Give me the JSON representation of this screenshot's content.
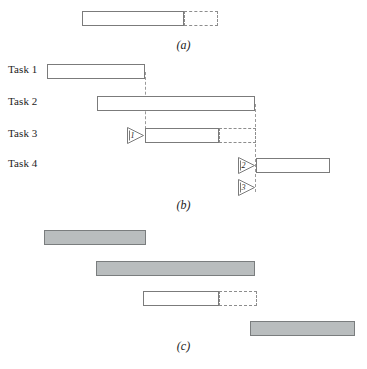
{
  "figure": {
    "type": "gantt-schedule-diagram",
    "panels": [
      {
        "key": "a",
        "caption": "(a)",
        "caption_y": 38,
        "bars": [
          {
            "name": "bar-a-actual",
            "style": "solid",
            "x": 82,
            "y": 11,
            "w": 102,
            "label": ""
          },
          {
            "name": "bar-a-float",
            "style": "dashed",
            "x": 184,
            "y": 11,
            "w": 34,
            "label": ""
          }
        ],
        "vlines": [],
        "hlines": [],
        "markers": []
      },
      {
        "key": "b",
        "caption": "(b)",
        "caption_y": 198,
        "rows": [
          {
            "name": "row-label-task-1",
            "label": "Task 1",
            "x": 8,
            "y": 64
          },
          {
            "name": "row-label-task-2",
            "label": "Task 2",
            "x": 8,
            "y": 96
          },
          {
            "name": "row-label-task-3",
            "label": "Task 3",
            "x": 8,
            "y": 128
          },
          {
            "name": "row-label-task-4",
            "label": "Task 4",
            "x": 8,
            "y": 158
          }
        ],
        "bars": [
          {
            "name": "bar-task-1",
            "style": "solid",
            "x": 47,
            "y": 64,
            "w": 98,
            "label": ""
          },
          {
            "name": "bar-task-2",
            "style": "solid",
            "x": 97,
            "y": 96,
            "w": 158,
            "label": ""
          },
          {
            "name": "bar-task-3-actual",
            "style": "solid",
            "x": 145,
            "y": 128,
            "w": 74,
            "label": ""
          },
          {
            "name": "bar-task-3-float",
            "style": "dashed",
            "x": 219,
            "y": 128,
            "w": 37,
            "label": ""
          },
          {
            "name": "bar-task-4",
            "style": "solid",
            "x": 256,
            "y": 158,
            "w": 74,
            "label": ""
          }
        ],
        "vlines": [
          {
            "name": "dependency-line-task-1",
            "x": 145,
            "y": 72,
            "h": 62
          },
          {
            "name": "dependency-line-task-2",
            "x": 255,
            "y": 104,
            "h": 88
          }
        ],
        "hlines": [],
        "markers": [
          {
            "name": "dependency-marker-1",
            "number": "1",
            "x": 126,
            "y": 126
          },
          {
            "name": "dependency-marker-2",
            "number": "2",
            "x": 237,
            "y": 156
          },
          {
            "name": "dependency-marker-3",
            "number": "3",
            "x": 237,
            "y": 178
          }
        ]
      },
      {
        "key": "c",
        "caption": "(c)",
        "caption_y": 339,
        "bars": [
          {
            "name": "bar-c-1",
            "style": "filled",
            "x": 44,
            "y": 230,
            "w": 102,
            "label": ""
          },
          {
            "name": "bar-c-2",
            "style": "filled",
            "x": 96,
            "y": 261,
            "w": 159,
            "label": ""
          },
          {
            "name": "bar-c-3-actual",
            "style": "solid",
            "x": 143,
            "y": 291,
            "w": 76,
            "label": ""
          },
          {
            "name": "bar-c-3-float",
            "style": "dashed",
            "x": 219,
            "y": 291,
            "w": 38,
            "label": ""
          },
          {
            "name": "bar-c-4",
            "style": "filled",
            "x": 250,
            "y": 321,
            "w": 105,
            "label": ""
          }
        ],
        "vlines": [],
        "hlines": [],
        "markers": []
      }
    ]
  },
  "colors": {
    "bar_outline": "#7b7b7b",
    "bar_fill_gray": "#b9bdbe",
    "bar_fill_white": "#ffffff",
    "guide_line": "#9a9a9a",
    "text": "#1c1c1c",
    "background": "#ffffff"
  }
}
